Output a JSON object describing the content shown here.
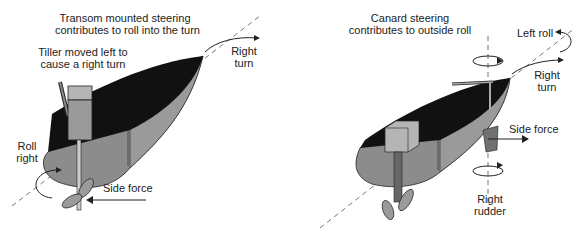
{
  "left_panel": {
    "title_line1": "Transom mounted steering",
    "title_line2": "contributes to roll into the turn",
    "tiller_line1": "Tiller moved left to",
    "tiller_line2": "cause a right turn",
    "turn_line1": "Right",
    "turn_line2": "turn",
    "roll_line1": "Roll",
    "roll_line2": "right",
    "side_force": "Side force"
  },
  "right_panel": {
    "title_line1": "Canard steering",
    "title_line2": "contributes to outside roll",
    "left_roll": "Left roll",
    "turn_line1": "Right",
    "turn_line2": "turn",
    "side_force": "Side force",
    "rudder_line1": "Right",
    "rudder_line2": "rudder"
  },
  "colors": {
    "deck": "#111111",
    "hull": "#8c8c8c",
    "hull_dark": "#6e6e6e",
    "box": "#a8a8a8",
    "line": "#333333"
  }
}
